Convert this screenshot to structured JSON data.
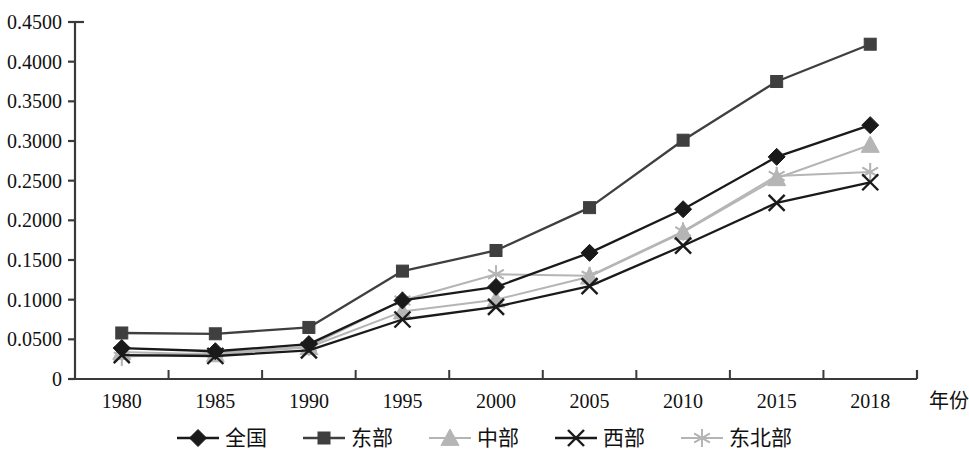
{
  "chart_data": {
    "type": "line",
    "title": "",
    "subtitle": "",
    "xlabel": "年份",
    "ylabel": "",
    "categories": [
      "1980",
      "1985",
      "1990",
      "1995",
      "2000",
      "2005",
      "2010",
      "2015",
      "2018"
    ],
    "ylim": [
      0,
      0.45
    ],
    "ytick_labels": [
      "0",
      "0.0500",
      "0.1000",
      "0.1500",
      "0.2000",
      "0.2500",
      "0.3000",
      "0.3500",
      "0.4000",
      "0.4500"
    ],
    "ytick_values": [
      0,
      0.05,
      0.1,
      0.15,
      0.2,
      0.25,
      0.3,
      0.35,
      0.4,
      0.45
    ],
    "grid": false,
    "legend_position": "bottom",
    "series": [
      {
        "name": "全国",
        "marker": "diamond",
        "color": "#1a1a1a",
        "values": [
          0.039,
          0.035,
          0.044,
          0.099,
          0.116,
          0.159,
          0.214,
          0.28,
          0.32
        ]
      },
      {
        "name": "东部",
        "marker": "square",
        "color": "#3f3f3f",
        "values": [
          0.058,
          0.057,
          0.065,
          0.136,
          0.162,
          0.216,
          0.301,
          0.375,
          0.422
        ]
      },
      {
        "name": "中部",
        "marker": "triangle",
        "color": "#b5b5b5",
        "values": [
          0.034,
          0.031,
          0.04,
          0.085,
          0.1,
          0.129,
          0.185,
          0.253,
          0.295
        ]
      },
      {
        "name": "西部",
        "marker": "x",
        "color": "#1a1a1a",
        "values": [
          0.03,
          0.029,
          0.036,
          0.075,
          0.091,
          0.117,
          0.168,
          0.222,
          0.248
        ]
      },
      {
        "name": "东北部",
        "marker": "asterisk",
        "color": "#b5b5b5",
        "values": [
          0.028,
          0.033,
          0.041,
          0.099,
          0.132,
          0.13,
          0.186,
          0.256,
          0.261
        ]
      }
    ]
  },
  "axes": {
    "axis_color": "#3a3a3a",
    "x_axis_title": "年份"
  },
  "legend": {
    "items": [
      {
        "label": "全国",
        "marker": "diamond-marker",
        "color": "#1a1a1a"
      },
      {
        "label": "东部",
        "marker": "square-marker",
        "color": "#3f3f3f"
      },
      {
        "label": "中部",
        "marker": "triangle-marker",
        "color": "#b5b5b5"
      },
      {
        "label": "西部",
        "marker": "x-marker",
        "color": "#1a1a1a"
      },
      {
        "label": "东北部",
        "marker": "asterisk-marker",
        "color": "#b5b5b5"
      }
    ]
  }
}
